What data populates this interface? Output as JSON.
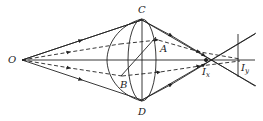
{
  "diagram": {
    "labels": {
      "O": "O",
      "C": "C",
      "D": "D",
      "A": "A",
      "B": "B",
      "Ix_main": "I",
      "Ix_sub": "x",
      "Iy_main": "I",
      "Iy_sub": "y"
    },
    "colors": {
      "line": "#222222",
      "background": "#ffffff"
    }
  }
}
